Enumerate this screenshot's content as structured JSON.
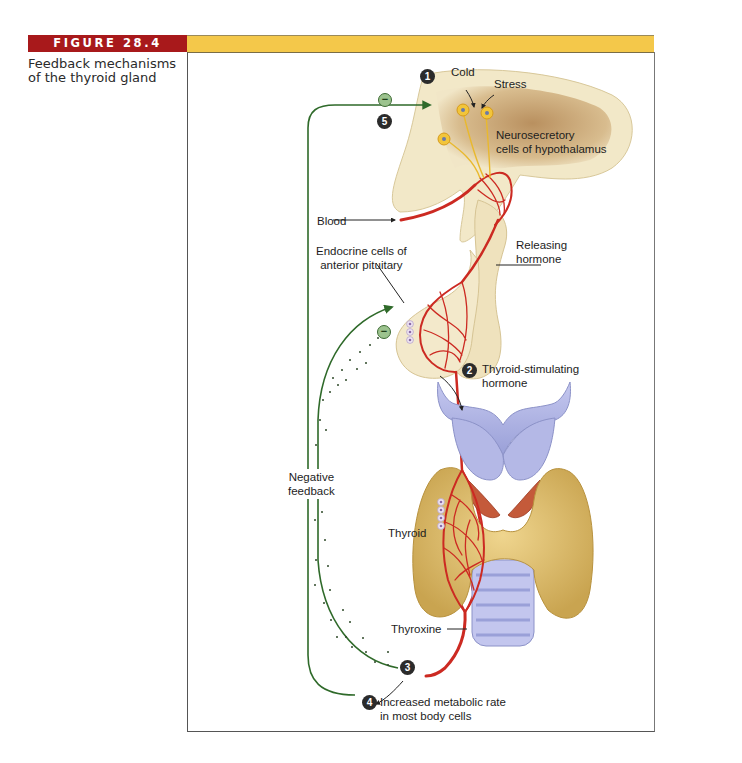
{
  "figure": {
    "tag": "FIGURE 28.4",
    "caption": "Feedback mechanisms of the thyroid gland",
    "colors": {
      "tag_red": "#a8191b",
      "bar_yellow": "#f4c84a",
      "feedback_green": "#2f6a2a",
      "blood_red": "#cc2a22",
      "tissue_beige": "#f1e6c2",
      "hypothalamus_brown": "#c9a577",
      "cartilage_lavender": "#aeb2e2",
      "thyroid_tan": "#dcbb6a"
    }
  },
  "steps": [
    {
      "number": "1",
      "label": "Cold"
    },
    {
      "number": "2",
      "label": "Thyroid-stimulating hormone"
    },
    {
      "number": "3",
      "label": ""
    },
    {
      "number": "4",
      "label": "Increased metabolic rate in most body cells"
    },
    {
      "number": "5",
      "label": ""
    }
  ],
  "labels": {
    "cold": "Cold",
    "stress": "Stress",
    "neurosecretory_1": "Neurosecretory",
    "neurosecretory_2": "cells of hypothalamus",
    "blood": "Blood",
    "releasing_1": "Releasing",
    "releasing_2": "hormone",
    "endocrine_1": "Endocrine cells of",
    "endocrine_2": "anterior pituitary",
    "tsh_1": "Thyroid-stimulating",
    "tsh_2": "hormone",
    "negative_1": "Negative",
    "negative_2": "feedback",
    "thyroid": "Thyroid",
    "thyroxine": "Thyroxine",
    "metabolic_1": "Increased metabolic rate",
    "metabolic_2": "in most body cells",
    "inhibit_symbol": "−"
  }
}
